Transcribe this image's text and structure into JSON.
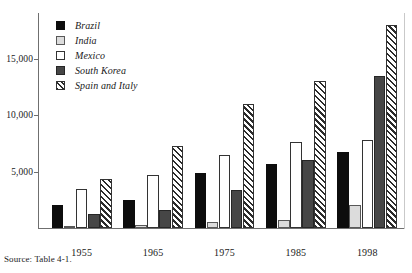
{
  "source_note": "Source: Table 4-1.",
  "legend": {
    "items": [
      {
        "label": "Brazil",
        "key": "brazil",
        "swatch": "solid-black-square-icon"
      },
      {
        "label": "India",
        "key": "india",
        "swatch": "light-gray-square-icon"
      },
      {
        "label": "Mexico",
        "key": "mexico",
        "swatch": "white-square-icon"
      },
      {
        "label": "South Korea",
        "key": "korea",
        "swatch": "dark-gray-square-icon"
      },
      {
        "label": "Spain and Italy",
        "key": "spain",
        "swatch": "diagonal-hatch-square-icon"
      }
    ]
  },
  "axes": {
    "y_ticks": [
      {
        "label": "5,000",
        "value": 5000
      },
      {
        "label": "10,000",
        "value": 10000
      },
      {
        "label": "15,000",
        "value": 15000
      }
    ],
    "x_ticks": [
      "1955",
      "1965",
      "1975",
      "1985",
      "1998"
    ]
  },
  "chart_data": {
    "type": "bar",
    "title": "",
    "subtitle": "",
    "xlabel": "",
    "ylabel": "",
    "ylim": [
      0,
      18700
    ],
    "grid": false,
    "legend_position": "top-left-inside",
    "categories": [
      "1955",
      "1965",
      "1975",
      "1985",
      "1998"
    ],
    "series": [
      {
        "name": "Brazil",
        "values": [
          2000,
          2500,
          4900,
          5700,
          6700
        ]
      },
      {
        "name": "India",
        "values": [
          200,
          300,
          500,
          700,
          2000
        ]
      },
      {
        "name": "Mexico",
        "values": [
          3500,
          4700,
          6500,
          7600,
          7800
        ]
      },
      {
        "name": "South Korea",
        "values": [
          1200,
          1600,
          3400,
          6000,
          13500
        ]
      },
      {
        "name": "Spain and Italy",
        "values": [
          4300,
          7300,
          11000,
          13000,
          18000
        ]
      }
    ],
    "annotations": [
      "Source: Table 4-1."
    ]
  }
}
